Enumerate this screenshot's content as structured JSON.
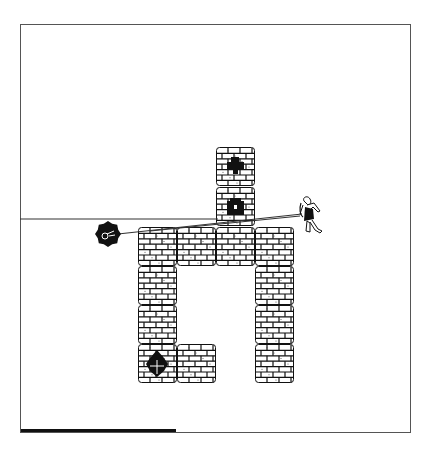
{
  "game": {
    "frame": {
      "x": 20,
      "y": 24,
      "width": 391,
      "height": 409
    },
    "tile_size": 39,
    "tiles": [
      {
        "col": 0,
        "row": 0,
        "x": 216,
        "y": 147,
        "type": "brick",
        "item": "cross-key"
      },
      {
        "col": 0,
        "row": 1,
        "x": 216,
        "y": 187,
        "type": "brick",
        "item": "chest"
      },
      {
        "x": 138,
        "y": 227,
        "type": "brick"
      },
      {
        "x": 177,
        "y": 227,
        "type": "brick"
      },
      {
        "x": 216,
        "y": 227,
        "type": "brick"
      },
      {
        "x": 255,
        "y": 227,
        "type": "brick"
      },
      {
        "x": 138,
        "y": 266,
        "type": "brick"
      },
      {
        "x": 255,
        "y": 266,
        "type": "brick"
      },
      {
        "x": 138,
        "y": 305,
        "type": "brick"
      },
      {
        "x": 255,
        "y": 305,
        "type": "brick"
      },
      {
        "x": 138,
        "y": 344,
        "type": "brick",
        "item": "shield-gem"
      },
      {
        "x": 177,
        "y": 344,
        "type": "brick"
      },
      {
        "x": 255,
        "y": 344,
        "type": "brick"
      }
    ],
    "player": {
      "x": 298,
      "y": 197,
      "icon": "warrior-figure"
    },
    "enemy": {
      "x": 108,
      "y": 234,
      "r": 11,
      "icon": "spiked-ball"
    },
    "lines": [
      {
        "x1": 20,
        "y1": 219,
        "x2": 218,
        "y2": 219
      },
      {
        "x1": 118,
        "y1": 234,
        "x2": 302,
        "y2": 214
      },
      {
        "x1": 150,
        "y1": 231,
        "x2": 300,
        "y2": 216
      }
    ],
    "health_bar": {
      "width": 155,
      "color": "#111111"
    }
  }
}
